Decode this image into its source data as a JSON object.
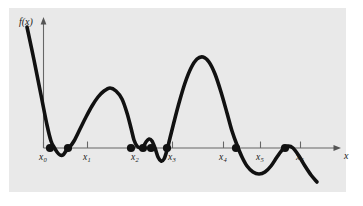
{
  "figure": {
    "title": "",
    "background_color": "#e9e9e9",
    "page_color": "#ffffff",
    "curve_color": "#111111",
    "axis_color": "#666666",
    "marker_color": "#111111"
  },
  "chart_data": {
    "type": "line",
    "title": "",
    "xlabel": "x",
    "ylabel": "f(x)",
    "grid": false,
    "legend": null,
    "axis_style": {
      "x_axis_arrow": true,
      "y_axis_arrow": true,
      "x_axis_origin_px": [
        43,
        148
      ],
      "x_axis_end_px": [
        340,
        148
      ],
      "y_axis_top_px": [
        43,
        18
      ]
    },
    "xticks": {
      "labels": [
        "x0",
        "x1",
        "x2",
        "x3",
        "x4",
        "x5",
        "x6"
      ],
      "display": [
        "x₀",
        "x₁",
        "x₂",
        "x₃",
        "x₄",
        "x₅",
        "x₆"
      ],
      "subscripts": [
        "0",
        "1",
        "2",
        "3",
        "4",
        "5",
        "6"
      ],
      "base": "x",
      "positions_px": [
        43,
        87,
        135,
        172,
        223,
        260,
        300
      ]
    },
    "roots": {
      "description": "filled dots where the curve touches or crosses the x-axis",
      "count": 8,
      "x_px": [
        50,
        68,
        131,
        143,
        167,
        236,
        285,
        151
      ],
      "y_px": [
        148,
        148,
        148,
        148,
        148,
        148,
        148,
        148
      ]
    },
    "curve_points_px": [
      [
        27,
        27
      ],
      [
        34,
        60
      ],
      [
        41,
        95
      ],
      [
        47,
        125
      ],
      [
        51,
        141
      ],
      [
        54,
        147
      ],
      [
        57,
        152
      ],
      [
        60,
        155
      ],
      [
        63,
        155
      ],
      [
        66,
        151
      ],
      [
        69,
        148
      ],
      [
        74,
        141
      ],
      [
        80,
        129
      ],
      [
        86,
        117
      ],
      [
        92,
        106
      ],
      [
        98,
        97
      ],
      [
        104,
        91
      ],
      [
        110,
        88
      ],
      [
        116,
        91
      ],
      [
        122,
        99
      ],
      [
        127,
        113
      ],
      [
        131,
        128
      ],
      [
        134,
        140
      ],
      [
        137,
        146
      ],
      [
        140,
        148
      ],
      [
        143,
        147
      ],
      [
        146,
        142
      ],
      [
        149,
        139
      ],
      [
        152,
        141
      ],
      [
        155,
        148
      ],
      [
        158,
        157
      ],
      [
        161,
        161
      ],
      [
        164,
        159
      ],
      [
        167,
        150
      ],
      [
        170,
        138
      ],
      [
        174,
        122
      ],
      [
        179,
        103
      ],
      [
        185,
        83
      ],
      [
        191,
        68
      ],
      [
        197,
        59
      ],
      [
        203,
        57
      ],
      [
        209,
        62
      ],
      [
        215,
        74
      ],
      [
        221,
        92
      ],
      [
        227,
        113
      ],
      [
        232,
        131
      ],
      [
        237,
        145
      ],
      [
        242,
        157
      ],
      [
        247,
        166
      ],
      [
        253,
        172
      ],
      [
        259,
        174
      ],
      [
        265,
        172
      ],
      [
        271,
        166
      ],
      [
        277,
        157
      ],
      [
        283,
        149
      ],
      [
        288,
        146
      ],
      [
        293,
        148
      ],
      [
        299,
        156
      ],
      [
        305,
        166
      ],
      [
        311,
        175
      ],
      [
        317,
        182
      ]
    ]
  },
  "labels": {
    "y_axis": "f(x)",
    "x_axis": "x"
  }
}
